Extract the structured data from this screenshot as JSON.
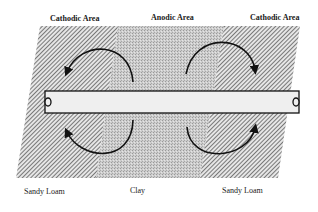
{
  "diagram": {
    "top_labels": [
      {
        "id": "cathodic-left",
        "text": "Cathodic Area"
      },
      {
        "id": "anodic-center",
        "text": "Anodic Area"
      },
      {
        "id": "cathodic-right",
        "text": "Cathodic Area"
      }
    ],
    "bottom_labels": [
      {
        "id": "soil-left",
        "text": "Sandy Loam"
      },
      {
        "id": "soil-center",
        "text": "Clay"
      },
      {
        "id": "soil-right",
        "text": "Sandy Loam"
      }
    ],
    "regions": [
      {
        "name": "Sandy Loam",
        "pattern": "diagonal-hatch",
        "role": "cathodic"
      },
      {
        "name": "Clay",
        "pattern": "stipple",
        "role": "anodic"
      },
      {
        "name": "Sandy Loam",
        "pattern": "diagonal-hatch",
        "role": "cathodic"
      }
    ],
    "elements": {
      "pipe": "horizontal pipe spanning all three soil regions",
      "current_flow": "curved arrows showing circulating current loops between anodic and cathodic areas"
    },
    "colors": {
      "hatch_dark": "#555555",
      "hatch_light": "#e8e8e8",
      "stipple": "#c4c4c4",
      "pipe_fill": "#eeeeee",
      "outline": "#111111"
    }
  }
}
